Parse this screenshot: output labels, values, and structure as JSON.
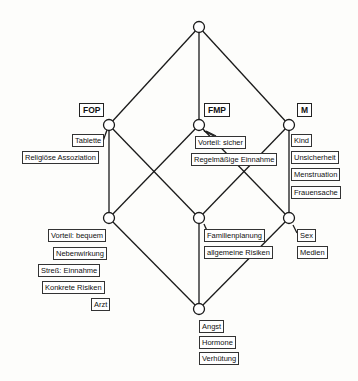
{
  "diagram": {
    "type": "concept-lattice",
    "attributes": [
      "FOP",
      "FMP",
      "M"
    ],
    "nodes": {
      "top": {
        "x": 199,
        "y": 27
      },
      "fop": {
        "x": 109,
        "y": 125
      },
      "fmp": {
        "x": 199,
        "y": 125
      },
      "m": {
        "x": 289,
        "y": 125
      },
      "left_mid": {
        "x": 109,
        "y": 218
      },
      "center_mid": {
        "x": 199,
        "y": 218
      },
      "right_mid": {
        "x": 289,
        "y": 218
      },
      "bottom": {
        "x": 199,
        "y": 309
      }
    },
    "edges": [
      [
        "top",
        "fop"
      ],
      [
        "top",
        "fmp"
      ],
      [
        "top",
        "m"
      ],
      [
        "fop",
        "left_mid"
      ],
      [
        "fop",
        "center_mid"
      ],
      [
        "fmp",
        "left_mid"
      ],
      [
        "fmp",
        "right_mid"
      ],
      [
        "m",
        "center_mid"
      ],
      [
        "m",
        "right_mid"
      ],
      [
        "left_mid",
        "bottom"
      ],
      [
        "center_mid",
        "bottom"
      ],
      [
        "right_mid",
        "bottom"
      ]
    ],
    "labels": {
      "fop": [
        "Tablette",
        "Religiöse Assoziation"
      ],
      "fmp": [
        "Vorteil: sicher",
        "Regelmäßige Einnahme"
      ],
      "m": [
        "Kind",
        "Unsicherheit",
        "Menstruation",
        "Frauensache"
      ],
      "left_mid": [
        "Vorteil: bequem",
        "Nebenwirkung",
        "Streß: Einnahme",
        "Konkrete Risiken",
        "Arzt"
      ],
      "center_mid": [
        "Familienplanung",
        "allgemeine Risiken"
      ],
      "right_mid": [
        "Sex",
        "Medien"
      ],
      "bottom": [
        "Angst",
        "Hormone",
        "Verhütung"
      ]
    }
  }
}
